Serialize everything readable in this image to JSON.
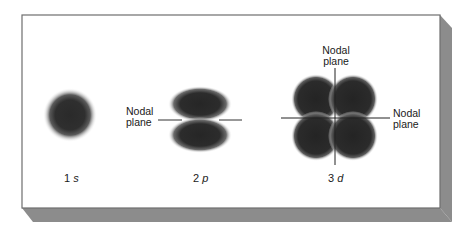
{
  "figure": {
    "panel": {
      "background": "#ffffff",
      "border": "#6e6e6e",
      "shadow": "#8c8c8c"
    },
    "orbital_color": "#2a2a2a",
    "orbitals": [
      {
        "id": "1s",
        "number": "1",
        "letter": "s"
      },
      {
        "id": "2p",
        "number": "2",
        "letter": "p",
        "nodal_label": [
          "Nodal",
          "plane"
        ]
      },
      {
        "id": "3d",
        "number": "3",
        "letter": "d",
        "nodal_label_top": [
          "Nodal",
          "plane"
        ],
        "nodal_label_right": [
          "Nodal",
          "plane"
        ]
      }
    ]
  }
}
